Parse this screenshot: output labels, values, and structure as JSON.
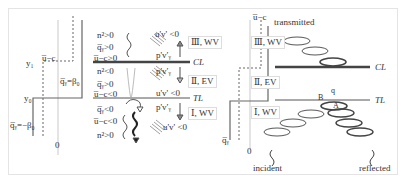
{
  "panel_left": {
    "y_labels": {
      "y1": "y₁",
      "y0": "y₀"
    },
    "u_minus_c": "u̅−c",
    "q_pos": "q̅ᵧ=β₀",
    "q_neg": "q̅ᵧ=−β₀",
    "zero": "0"
  },
  "panel_middle": {
    "upper_conditions": [
      "n²>0",
      "q̅ᵧ>0",
      "u̅−c>0"
    ],
    "middle_conditions": [
      "n²<0",
      "q̅ᵧ>0",
      "u̅−c<0"
    ],
    "lower_conditions": [
      "q̅ᵧ<0",
      "u̅−c<0",
      "n²>0"
    ],
    "flux_labels": {
      "upper_uv": "u'v' <0",
      "upper_pv": "p'v′ᵧ",
      "mid_pv": "p'v′ᵧ",
      "mid_uv": "u'v' <0",
      "low_pv": "p'v′ᵧ",
      "low_uv": "u'v' <0"
    },
    "regions": [
      "Ⅲ, WV",
      "Ⅱ, EV",
      "Ⅰ, WV"
    ],
    "lines": {
      "cl": "CL",
      "tl": "TL"
    }
  },
  "panel_right": {
    "u_minus_c": "u̅−c",
    "q_label": "q̅ᵧ",
    "zero": "0",
    "regions": [
      "Ⅲ, WV",
      "Ⅱ, EV",
      "Ⅰ, WV"
    ],
    "lines": {
      "cl": "CL",
      "tl": "TL"
    },
    "wave_labels": {
      "transmitted": "transmitted",
      "incident": "incident",
      "reflected": "reflected"
    },
    "point_labels": {
      "A": "A",
      "B": "B",
      "q": "q"
    }
  },
  "colors": {
    "line": "#555555",
    "thick": "#444444",
    "text": "#333333",
    "frame": "#e4e4e4"
  }
}
